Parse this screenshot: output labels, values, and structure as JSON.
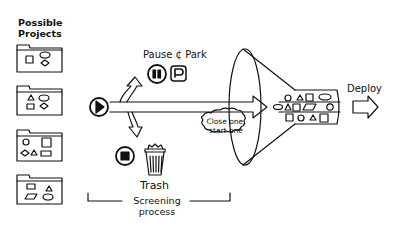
{
  "diagram": {
    "labels": {
      "possible_projects_line1": "Possible",
      "possible_projects_line2": "Projects",
      "pause_park": "Pause ¢ Park",
      "park_symbol": "P",
      "trash": "Trash",
      "screening_line1": "Screening",
      "screening_line2": "process",
      "cloud_line1": "Close one,",
      "cloud_line2": "start one",
      "deploy": "Deploy"
    },
    "folders": [
      {
        "shapes": [
          "square",
          "ellipse",
          "diamond"
        ]
      },
      {
        "shapes": [
          "triangle",
          "ellipse",
          "rectangle",
          "diamond"
        ]
      },
      {
        "shapes": [
          "circle",
          "square",
          "diamond",
          "triangle",
          "rectangle"
        ]
      },
      {
        "shapes": [
          "rectangle",
          "triangle",
          "parallelogram",
          "ellipse"
        ]
      }
    ],
    "funnel_rows": [
      [
        "circle",
        "triangle",
        "square",
        "ellipse"
      ],
      [
        "ellipse",
        "triangle",
        "square",
        "parallelogram",
        "circle"
      ],
      [
        "square",
        "circle",
        "triangle",
        "square"
      ]
    ],
    "icons": [
      "play-icon",
      "pause-icon",
      "park-icon",
      "stop-icon",
      "trash-icon",
      "deploy-arrow-icon"
    ],
    "colors": {
      "stroke": "#111111",
      "background": "#ffffff"
    }
  }
}
